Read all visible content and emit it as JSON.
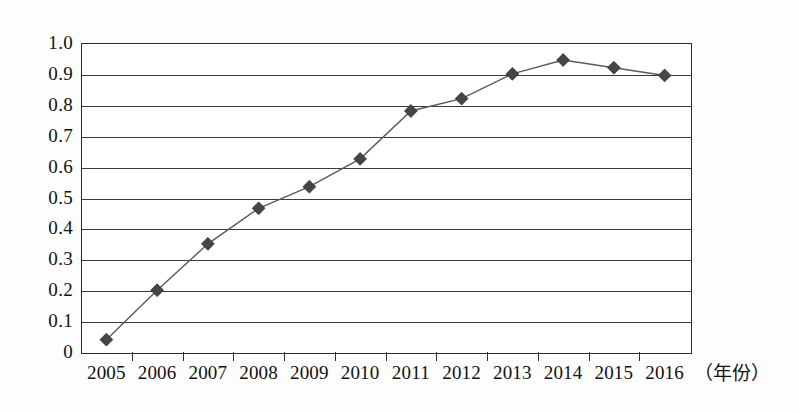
{
  "chart_data": {
    "type": "line",
    "title": "",
    "subtitle": "",
    "xlabel": "（年份）",
    "ylabel": "",
    "categories": [
      "2005",
      "2006",
      "2007",
      "2008",
      "2009",
      "2010",
      "2011",
      "2012",
      "2013",
      "2014",
      "2015",
      "2016"
    ],
    "values": [
      0.04,
      0.2,
      0.35,
      0.465,
      0.535,
      0.625,
      0.78,
      0.82,
      0.9,
      0.945,
      0.92,
      0.895
    ],
    "series": [
      {
        "name": "",
        "values": [
          0.04,
          0.2,
          0.35,
          0.465,
          0.535,
          0.625,
          0.78,
          0.82,
          0.9,
          0.945,
          0.92,
          0.895
        ]
      }
    ],
    "ylim": [
      0,
      1.0
    ],
    "ytick_labels": [
      "1.0",
      "0.9",
      "0.8",
      "0.7",
      "0.6",
      "0.5",
      "0.4",
      "0.3",
      "0.2",
      "0.1",
      "0"
    ],
    "ytick_values": [
      1.0,
      0.9,
      0.8,
      0.7,
      0.6,
      0.5,
      0.4,
      0.3,
      0.2,
      0.1,
      0
    ],
    "xtick_labels": [
      "2005",
      "2006",
      "2007",
      "2008",
      "2009",
      "2010",
      "2011",
      "2012",
      "2013",
      "2014",
      "2015",
      "2016"
    ],
    "grid": true,
    "grid_orientation": "horizontal",
    "legend": false,
    "legend_position": "none",
    "marker": "diamond",
    "annotations": []
  },
  "style": {
    "line_color": "#5a5a5a",
    "marker_color": "#454545",
    "axis_color": "#2b2b2b",
    "grid_color": "#3a3a3a",
    "text_color": "#111111",
    "background": "#ffffff"
  }
}
